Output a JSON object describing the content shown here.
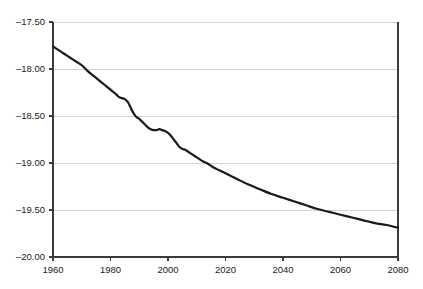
{
  "chart_data": {
    "type": "line",
    "title": "",
    "subtitle": "",
    "xlabel": "",
    "ylabel": "",
    "xlim": [
      1960,
      2080
    ],
    "ylim": [
      -20.0,
      -17.5
    ],
    "grid": true,
    "legend": false,
    "legend_position": "none",
    "line_color": "#1a1a1a",
    "grid_color": "#c8c8c8",
    "axis_color": "#3a3a3a",
    "background_color": "#ffffff",
    "x_ticks": [
      1960,
      1980,
      2000,
      2020,
      2040,
      2060,
      2080
    ],
    "x_tick_labels": [
      "1960",
      "1980",
      "2000",
      "2020",
      "2040",
      "2060",
      "2080"
    ],
    "y_ticks": [
      -17.5,
      -18.0,
      -18.5,
      -19.0,
      -19.5,
      -20.0
    ],
    "y_tick_labels": [
      "–17.50",
      "–18.00",
      "–18.50",
      "–19.00",
      "–19.50",
      "–20.00"
    ],
    "series": [
      {
        "name": "series-1",
        "x": [
          1960,
          1962,
          1964,
          1966,
          1968,
          1970,
          1972,
          1974,
          1976,
          1978,
          1980,
          1982,
          1983,
          1984,
          1985,
          1986,
          1987,
          1988,
          1989,
          1990,
          1991,
          1992,
          1993,
          1994,
          1995,
          1996,
          1997,
          1998,
          1999,
          2000,
          2001,
          2002,
          2003,
          2004,
          2005,
          2006,
          2007,
          2008,
          2010,
          2012,
          2014,
          2016,
          2018,
          2020,
          2024,
          2028,
          2032,
          2036,
          2040,
          2044,
          2048,
          2052,
          2056,
          2060,
          2064,
          2068,
          2072,
          2076,
          2080
        ],
        "values": [
          -17.76,
          -17.8,
          -17.84,
          -17.88,
          -17.92,
          -17.96,
          -18.02,
          -18.07,
          -18.12,
          -18.17,
          -18.22,
          -18.27,
          -18.3,
          -18.31,
          -18.32,
          -18.35,
          -18.41,
          -18.47,
          -18.51,
          -18.53,
          -18.56,
          -18.59,
          -18.62,
          -18.64,
          -18.65,
          -18.65,
          -18.64,
          -18.65,
          -18.66,
          -18.68,
          -18.71,
          -18.75,
          -18.79,
          -18.83,
          -18.85,
          -18.86,
          -18.88,
          -18.9,
          -18.94,
          -18.98,
          -19.01,
          -19.05,
          -19.08,
          -19.11,
          -19.17,
          -19.23,
          -19.28,
          -19.33,
          -19.37,
          -19.41,
          -19.45,
          -19.49,
          -19.52,
          -19.55,
          -19.58,
          -19.61,
          -19.64,
          -19.66,
          -19.69
        ]
      }
    ]
  },
  "axes": {
    "y_labels": [
      "–17.50",
      "–18.00",
      "–18.50",
      "–19.00",
      "–19.50",
      "–20.00"
    ],
    "x_labels": [
      "1960",
      "1980",
      "2000",
      "2020",
      "2040",
      "2060",
      "2080"
    ]
  }
}
